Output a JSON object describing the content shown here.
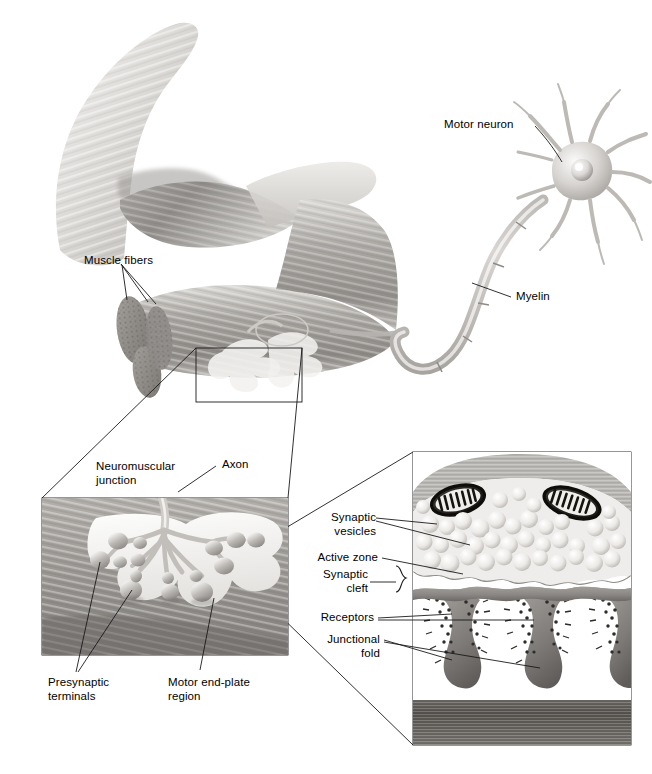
{
  "figure": {
    "title": "Neuromuscular junction",
    "background_color": "#ffffff",
    "ink_color": "#000000",
    "art_style": "grayscale pencil / airbrush medical illustration",
    "width": 652,
    "height": 774
  },
  "labels": {
    "motor_neuron": "Motor neuron",
    "myelin": "Myelin",
    "muscle_fibers": "Muscle fibers",
    "neuromuscular_junction": "Neuromuscular\njunction",
    "axon": "Axon",
    "presynaptic_terminals": "Presynaptic\nterminals",
    "motor_end_plate_region": "Motor end-plate\nregion",
    "synaptic_vesicles": "Synaptic\nvesicles",
    "active_zone": "Active zone",
    "synaptic_cleft": "Synaptic\ncleft",
    "receptors": "Receptors",
    "junctional_fold": "Junctional\nfold"
  },
  "panels": {
    "overview": {
      "name": "whole arm with biceps muscle and motor neuron",
      "elements": [
        "flexed arm silhouette",
        "biceps muscle belly",
        "muscle fiber bundle",
        "myelinated axon",
        "motor neuron cell body with dendrites"
      ]
    },
    "inset_left": {
      "name": "neuromuscular junction magnification",
      "box": {
        "x": 42,
        "y": 498,
        "width": 246,
        "height": 157
      },
      "elements": [
        "axon branching",
        "presynaptic terminals",
        "motor end-plate region",
        "striated muscle surface"
      ]
    },
    "inset_right": {
      "name": "synapse ultrastructure magnification",
      "box": {
        "x": 413,
        "y": 452,
        "width": 218,
        "height": 293
      },
      "elements": [
        "mitochondria",
        "synaptic vesicles",
        "active zones",
        "synaptic cleft",
        "receptors",
        "junctional folds",
        "muscle fiber cytoplasm"
      ]
    }
  },
  "colors": {
    "tissue_light": "#e9e7e4",
    "tissue_mid": "#b9b6b2",
    "tissue_dark": "#8a8784",
    "muscle_dark": "#6f6c69",
    "line": "#1a1a1a"
  }
}
